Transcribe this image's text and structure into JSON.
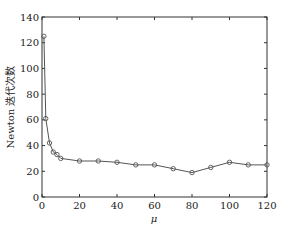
{
  "chart_data": {
    "type": "line",
    "title": "",
    "xlabel": "μ",
    "ylabel": "Newton 迭代次数",
    "xlim": [
      0,
      120
    ],
    "ylim": [
      0,
      140
    ],
    "xticks": [
      0,
      20,
      40,
      60,
      80,
      100,
      120
    ],
    "yticks": [
      0,
      20,
      40,
      60,
      80,
      100,
      120,
      140
    ],
    "grid": false,
    "legend": null,
    "series": [
      {
        "name": "Newton iterations",
        "marker": "circle",
        "color": "#555555",
        "x": [
          1,
          2,
          4,
          6,
          8,
          10,
          20,
          30,
          40,
          50,
          60,
          70,
          80,
          90,
          100,
          110,
          120
        ],
        "y": [
          125,
          61,
          42,
          35,
          33,
          30,
          28,
          28,
          27,
          25,
          25,
          22,
          19,
          23,
          27,
          25,
          25
        ]
      }
    ]
  }
}
